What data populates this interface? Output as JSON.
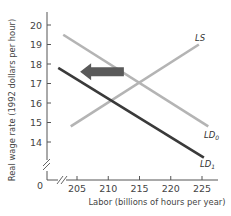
{
  "chart_data": {
    "type": "line",
    "title": "",
    "xlabel": "Labor (billions of hours per year)",
    "ylabel": "Real wage rate (1992 dollars per hour)",
    "xlim": [
      205,
      225
    ],
    "ylim": [
      14,
      20
    ],
    "x_ticks": [
      205,
      210,
      215,
      220,
      225
    ],
    "y_ticks": [
      14,
      15,
      16,
      17,
      18,
      19,
      20
    ],
    "origin_label": "0",
    "axis_breaks": {
      "x": true,
      "y": true
    },
    "grid": false,
    "legend": "none (curves labeled directly)",
    "series": [
      {
        "name": "LS",
        "label": "LS",
        "subscript": "",
        "color": "#b4b4b4",
        "points": [
          [
            204,
            14.8
          ],
          [
            224.5,
            19.0
          ]
        ]
      },
      {
        "name": "LD0",
        "label": "LD",
        "subscript": "0",
        "color": "#b4b4b4",
        "points": [
          [
            202.8,
            19.5
          ],
          [
            226,
            14.8
          ]
        ]
      },
      {
        "name": "LD1",
        "label": "LD",
        "subscript": "1",
        "color": "#3a3a3a",
        "points": [
          [
            202,
            17.8
          ],
          [
            225.3,
            13.2
          ]
        ]
      }
    ],
    "annotations": [
      {
        "type": "arrow",
        "direction": "left",
        "description": "Labor demand shifts leftward from LD0 to LD1",
        "color": "#5a5a5a",
        "from": [
          212.5,
          17.6
        ],
        "to": [
          205.5,
          17.6
        ]
      }
    ],
    "equilibrium": {
      "initial": {
        "x": 215,
        "y": 17
      }
    }
  }
}
